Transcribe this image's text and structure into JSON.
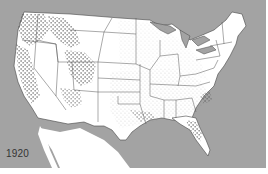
{
  "map": {
    "title": "",
    "year_label": "1920",
    "region": "Contiguous United States",
    "colors": {
      "water": "#a3a3a3",
      "land": "#ffffff",
      "border": "#555555",
      "dots": "#222222"
    },
    "legend": {
      "dense_dots": "Dense concentration (West: Pacific NW, Rockies, Utah/Arizona, California Sierra; Florida)",
      "fine_stipple": "Sparse stipple (Central and Southern states)"
    }
  }
}
